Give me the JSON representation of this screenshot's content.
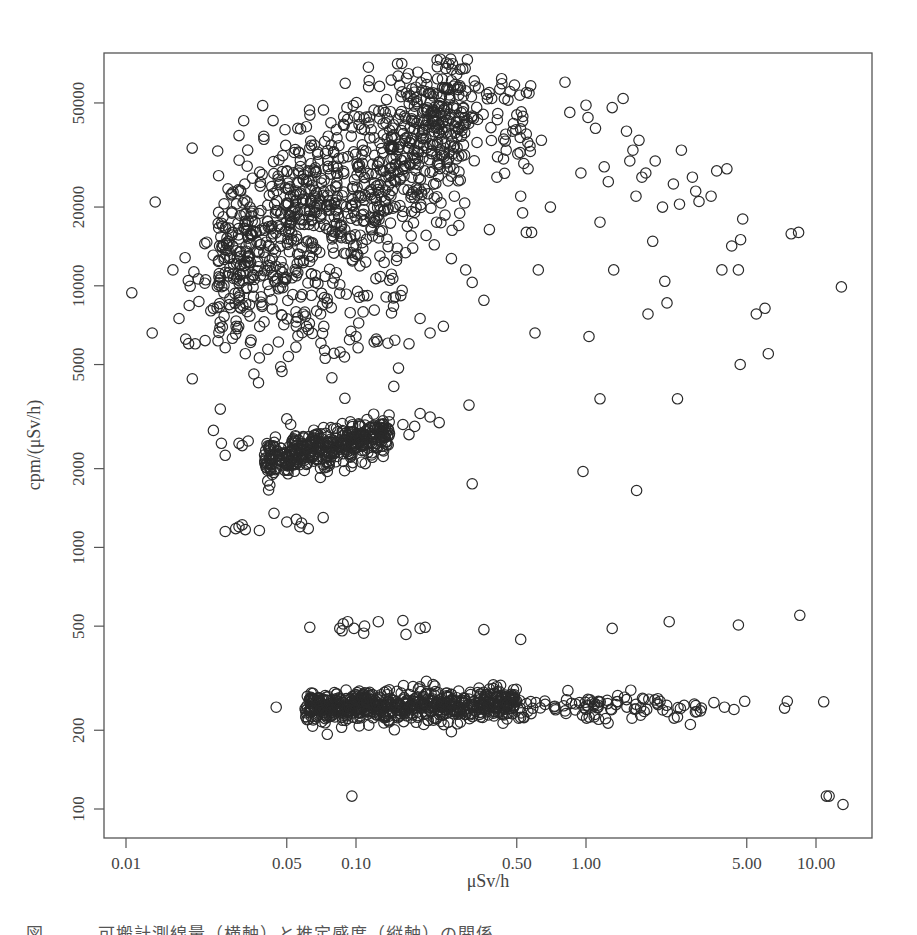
{
  "caption": "図　　　可搬計測線量（横軸）と推定感度（縦軸）の関係",
  "chart_data": {
    "type": "scatter",
    "title": "",
    "xlabel": "μSv/h",
    "ylabel": "cpm/(μSv/h)",
    "xscale": "log",
    "yscale": "log",
    "xlim": [
      0.0085,
      15
    ],
    "ylim": [
      83,
      70000
    ],
    "grid": false,
    "legend": null,
    "marker": "open-circle",
    "marker_color": "#2a2a2a",
    "x_ticks": [
      {
        "value": 0.01,
        "label": "0.01"
      },
      {
        "value": 0.05,
        "label": "0.05"
      },
      {
        "value": 0.1,
        "label": "0.10"
      },
      {
        "value": 0.5,
        "label": "0.50"
      },
      {
        "value": 1.0,
        "label": "1.00"
      },
      {
        "value": 5.0,
        "label": "5.00"
      },
      {
        "value": 10.0,
        "label": "10.00"
      }
    ],
    "y_ticks": [
      {
        "value": 100,
        "label": "100"
      },
      {
        "value": 200,
        "label": "200"
      },
      {
        "value": 500,
        "label": "500"
      },
      {
        "value": 1000,
        "label": "1000"
      },
      {
        "value": 2000,
        "label": "2000"
      },
      {
        "value": 5000,
        "label": "5000"
      },
      {
        "value": 10000,
        "label": "10000"
      },
      {
        "value": 20000,
        "label": "20000"
      },
      {
        "value": 50000,
        "label": "50000"
      }
    ],
    "clusters": [
      {
        "name": "high-sensitivity main band",
        "count": 900,
        "x_range": [
          0.025,
          0.3
        ],
        "y_at_xmin": 12000,
        "y_at_xmax": 45000,
        "log_y_spread": 0.16
      },
      {
        "name": "high-sensitivity lower scatter",
        "count": 160,
        "x_range": [
          0.018,
          0.16
        ],
        "y_at_xmin": 9000,
        "y_at_xmax": 9000,
        "log_y_spread": 0.17
      },
      {
        "name": "high-sensitivity upper plateau",
        "count": 90,
        "x_range": [
          0.2,
          0.6
        ],
        "y_at_xmin": 45000,
        "y_at_xmax": 42000,
        "log_y_spread": 0.1
      },
      {
        "name": "mid band ~2300",
        "count": 420,
        "x_range": [
          0.04,
          0.14
        ],
        "y_at_xmin": 2150,
        "y_at_xmax": 2700,
        "log_y_spread": 0.035
      },
      {
        "name": "low band ~250",
        "count": 700,
        "x_range": [
          0.06,
          0.5
        ],
        "y_at_xmin": 245,
        "y_at_xmax": 250,
        "log_y_spread": 0.03
      },
      {
        "name": "low band tail",
        "count": 90,
        "x_range": [
          0.5,
          3.2
        ],
        "y_at_xmin": 248,
        "y_at_xmax": 245,
        "log_y_spread": 0.025
      }
    ],
    "points": [
      [
        0.0106,
        9400
      ],
      [
        0.013,
        6600
      ],
      [
        0.0134,
        20900
      ],
      [
        0.0194,
        33600
      ],
      [
        0.031,
        37500
      ],
      [
        0.036,
        4600
      ],
      [
        0.016,
        11500
      ],
      [
        0.017,
        7500
      ],
      [
        0.02,
        6000
      ],
      [
        0.022,
        14500
      ],
      [
        0.024,
        8200
      ],
      [
        0.027,
        5800
      ],
      [
        0.029,
        6300
      ],
      [
        0.033,
        5500
      ],
      [
        0.035,
        6200
      ],
      [
        0.038,
        5300
      ],
      [
        0.046,
        6100
      ],
      [
        0.055,
        7000
      ],
      [
        0.062,
        6800
      ],
      [
        0.064,
        9200
      ],
      [
        0.075,
        8600
      ],
      [
        0.085,
        10100
      ],
      [
        0.095,
        6700
      ],
      [
        0.1,
        6400
      ],
      [
        0.12,
        6100
      ],
      [
        0.14,
        10500
      ],
      [
        0.17,
        6000
      ],
      [
        0.19,
        7500
      ],
      [
        0.24,
        7000
      ],
      [
        0.15,
        12500
      ],
      [
        0.21,
        6600
      ],
      [
        0.26,
        12700
      ],
      [
        0.3,
        11500
      ],
      [
        0.32,
        10300
      ],
      [
        0.28,
        17000
      ],
      [
        0.36,
        8800
      ],
      [
        0.38,
        16400
      ],
      [
        0.41,
        26000
      ],
      [
        0.45,
        33000
      ],
      [
        0.48,
        39000
      ],
      [
        0.5,
        45000
      ],
      [
        0.52,
        22000
      ],
      [
        0.53,
        19000
      ],
      [
        0.55,
        16000
      ],
      [
        0.56,
        28000
      ],
      [
        0.58,
        16000
      ],
      [
        0.6,
        6600
      ],
      [
        0.62,
        11500
      ],
      [
        0.64,
        36000
      ],
      [
        0.81,
        60000
      ],
      [
        0.7,
        20000
      ],
      [
        0.85,
        46000
      ],
      [
        0.95,
        27000
      ],
      [
        1.0,
        49000
      ],
      [
        1.02,
        44000
      ],
      [
        1.03,
        6400
      ],
      [
        1.1,
        40000
      ],
      [
        1.15,
        17500
      ],
      [
        1.2,
        28500
      ],
      [
        1.25,
        25000
      ],
      [
        1.3,
        48000
      ],
      [
        1.32,
        11500
      ],
      [
        1.45,
        52000
      ],
      [
        1.5,
        39000
      ],
      [
        1.55,
        30000
      ],
      [
        1.6,
        33000
      ],
      [
        1.65,
        22000
      ],
      [
        1.7,
        36000
      ],
      [
        1.75,
        26000
      ],
      [
        1.82,
        27000
      ],
      [
        1.86,
        7800
      ],
      [
        1.95,
        14800
      ],
      [
        2.0,
        30000
      ],
      [
        2.15,
        20000
      ],
      [
        2.2,
        10400
      ],
      [
        2.25,
        8600
      ],
      [
        2.4,
        24500
      ],
      [
        2.55,
        20500
      ],
      [
        2.6,
        33000
      ],
      [
        2.9,
        26000
      ],
      [
        3.0,
        23000
      ],
      [
        3.1,
        21000
      ],
      [
        3.5,
        22000
      ],
      [
        3.7,
        27500
      ],
      [
        3.9,
        11500
      ],
      [
        4.1,
        28000
      ],
      [
        4.3,
        14200
      ],
      [
        4.6,
        11500
      ],
      [
        4.7,
        15000
      ],
      [
        4.8,
        18000
      ],
      [
        5.5,
        7800
      ],
      [
        6.0,
        8200
      ],
      [
        6.2,
        5500
      ],
      [
        7.8,
        15800
      ],
      [
        8.4,
        16000
      ],
      [
        12.9,
        9900
      ],
      [
        4.68,
        5000
      ],
      [
        1.15,
        3700
      ],
      [
        2.5,
        3700
      ],
      [
        0.97,
        1950
      ],
      [
        1.66,
        1650
      ],
      [
        0.32,
        1750
      ],
      [
        0.31,
        3500
      ],
      [
        0.024,
        2800
      ],
      [
        0.026,
        2500
      ],
      [
        0.027,
        2250
      ],
      [
        0.031,
        2500
      ],
      [
        0.032,
        2450
      ],
      [
        0.034,
        2550
      ],
      [
        0.042,
        2200
      ],
      [
        0.043,
        2150
      ],
      [
        0.05,
        3100
      ],
      [
        0.052,
        2950
      ],
      [
        0.07,
        1850
      ],
      [
        0.075,
        1950
      ],
      [
        0.19,
        3250
      ],
      [
        0.21,
        3150
      ],
      [
        0.23,
        3000
      ],
      [
        0.16,
        2950
      ],
      [
        0.18,
        2900
      ],
      [
        0.17,
        2700
      ],
      [
        0.027,
        1150
      ],
      [
        0.03,
        1180
      ],
      [
        0.031,
        1200
      ],
      [
        0.032,
        1220
      ],
      [
        0.033,
        1170
      ],
      [
        0.038,
        1160
      ],
      [
        0.044,
        1350
      ],
      [
        0.05,
        1250
      ],
      [
        0.055,
        1280
      ],
      [
        0.057,
        1200
      ],
      [
        0.058,
        1240
      ],
      [
        0.062,
        1180
      ],
      [
        0.072,
        1300
      ],
      [
        0.063,
        495
      ],
      [
        0.085,
        490
      ],
      [
        0.087,
        480
      ],
      [
        0.088,
        510
      ],
      [
        0.092,
        520
      ],
      [
        0.098,
        490
      ],
      [
        0.108,
        470
      ],
      [
        0.109,
        500
      ],
      [
        0.125,
        520
      ],
      [
        0.16,
        525
      ],
      [
        0.165,
        465
      ],
      [
        0.19,
        490
      ],
      [
        0.2,
        495
      ],
      [
        0.36,
        485
      ],
      [
        0.52,
        445
      ],
      [
        1.3,
        490
      ],
      [
        2.3,
        520
      ],
      [
        4.6,
        505
      ],
      [
        8.5,
        550
      ],
      [
        0.045,
        245
      ],
      [
        0.075,
        193
      ],
      [
        0.096,
        112
      ],
      [
        11.1,
        112
      ],
      [
        11.4,
        112
      ],
      [
        13.1,
        104
      ],
      [
        10.8,
        257
      ],
      [
        7.5,
        258
      ],
      [
        7.3,
        243
      ],
      [
        4.9,
        258
      ],
      [
        4.4,
        240
      ],
      [
        4.0,
        245
      ],
      [
        3.6,
        255
      ],
      [
        2.5,
        225
      ],
      [
        2.1,
        258
      ],
      [
        1.5,
        262
      ],
      [
        1.0,
        240
      ],
      [
        0.9,
        252
      ],
      [
        0.8,
        248
      ]
    ]
  }
}
